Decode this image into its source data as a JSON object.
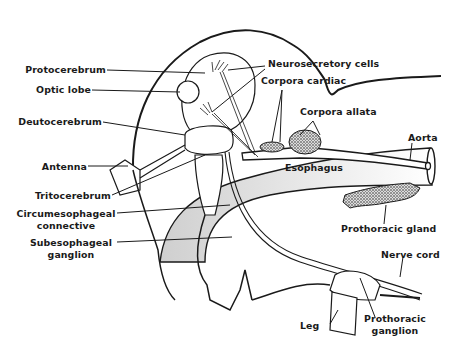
{
  "diagram": {
    "labels": {
      "protocerebrum": "Protocerebrum",
      "optic_lobe": "Optic lobe",
      "deutocerebrum": "Deutocerebrum",
      "antenna": "Antenna",
      "tritocerebrum": "Tritocerebrum",
      "circumesophageal_1": "Circumesophageal",
      "circumesophageal_2": "connective",
      "subesophageal_1": "Subesophageal",
      "subesophageal_2": "ganglion",
      "neurosecretory": "Neurosecretory cells",
      "corpora_cardiac": "Corpora cardiac",
      "corpora_allata": "Corpora allata",
      "aorta": "Aorta",
      "esophagus": "Esophagus",
      "prothoracic_gland": "Prothoracic gland",
      "nerve_cord": "Nerve cord",
      "leg": "Leg",
      "prothoracic_ganglion_1": "Prothoracic",
      "prothoracic_ganglion_2": "ganglion"
    },
    "colors": {
      "ink": "#1a1a1a",
      "stipple": "#9a9a9a",
      "background": "#ffffff"
    }
  }
}
